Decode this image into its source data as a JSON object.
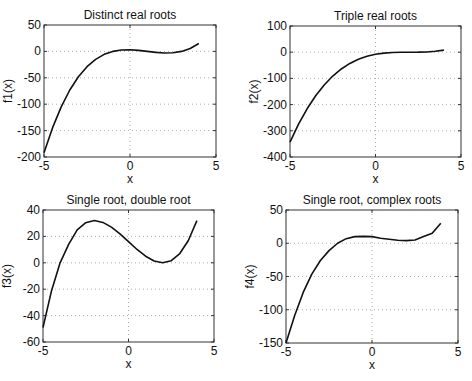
{
  "chart_data": [
    {
      "type": "line",
      "title": "Distinct real roots",
      "xlabel": "x",
      "ylabel": "f1(x)",
      "xlim": [
        -5,
        5
      ],
      "ylim": [
        -200,
        50
      ],
      "xticks": [
        -5,
        0,
        5
      ],
      "yticks": [
        -200,
        -150,
        -100,
        -50,
        0,
        50
      ],
      "grid": true,
      "function": "(x+1)(x-1)(x-3)",
      "x": [
        -5,
        -4.5,
        -4,
        -3.5,
        -3,
        -2.5,
        -2,
        -1.5,
        -1,
        -0.5,
        0,
        0.5,
        1,
        1.5,
        2,
        2.5,
        3,
        3.5,
        4
      ],
      "values": [
        -192,
        -144.4,
        -105,
        -73.1,
        -48,
        -28.9,
        -15,
        -5.6,
        0,
        2.6,
        3,
        1.9,
        0,
        -1.9,
        -3,
        -2.6,
        0,
        5.6,
        15
      ],
      "box": {
        "left": 44,
        "top": 25,
        "right": 216,
        "bottom": 157
      }
    },
    {
      "type": "line",
      "title": "Triple real roots",
      "xlabel": "x",
      "ylabel": "f2(x)",
      "xlim": [
        -5,
        5
      ],
      "ylim": [
        -400,
        100
      ],
      "xticks": [
        -5,
        0,
        5
      ],
      "yticks": [
        -400,
        -300,
        -200,
        -100,
        0,
        100
      ],
      "grid": true,
      "function": "(x-2)^3",
      "x": [
        -5,
        -4.5,
        -4,
        -3.5,
        -3,
        -2.5,
        -2,
        -1.5,
        -1,
        -0.5,
        0,
        0.5,
        1,
        1.5,
        2,
        2.5,
        3,
        3.5,
        4
      ],
      "values": [
        -343,
        -274.6,
        -216,
        -166.4,
        -125,
        -91.1,
        -64,
        -42.9,
        -27,
        -15.6,
        -8,
        -3.4,
        -1,
        -0.1,
        0,
        0.1,
        1,
        3.4,
        8
      ],
      "box": {
        "left": 290,
        "top": 26,
        "right": 461,
        "bottom": 157
      }
    },
    {
      "type": "line",
      "title": "Single root, double root",
      "xlabel": "x",
      "ylabel": "f3(x)",
      "xlim": [
        -5,
        5
      ],
      "ylim": [
        -60,
        40
      ],
      "xticks": [
        -5,
        0,
        5
      ],
      "yticks": [
        -60,
        -40,
        -20,
        0,
        20,
        40
      ],
      "grid": true,
      "function": "(x-2)^2 (x+4)",
      "x": [
        -5,
        -4.5,
        -4,
        -3.5,
        -3,
        -2.5,
        -2,
        -1.5,
        -1,
        -0.5,
        0,
        0.5,
        1,
        1.5,
        2,
        2.5,
        3,
        3.5,
        4
      ],
      "values": [
        -49,
        -21.1,
        0,
        13.9,
        25,
        30.4,
        32,
        30.6,
        27,
        21.9,
        16,
        10.1,
        5,
        1.4,
        0,
        1.6,
        7,
        16.9,
        32
      ],
      "box": {
        "left": 43,
        "top": 210,
        "right": 214,
        "bottom": 342
      }
    },
    {
      "type": "line",
      "title": "Single root, complex roots",
      "xlabel": "x",
      "ylabel": "f4(x)",
      "xlim": [
        -5,
        5
      ],
      "ylim": [
        -150,
        50
      ],
      "xticks": [
        -5,
        0,
        5
      ],
      "yticks": [
        -150,
        -100,
        -50,
        0,
        50
      ],
      "grid": true,
      "function": "(x+2)(x^2-4x+5)",
      "x": [
        -5,
        -4.5,
        -4,
        -3.5,
        -3,
        -2.5,
        -2,
        -1.5,
        -1,
        -0.5,
        0,
        0.5,
        1,
        1.5,
        2,
        2.5,
        3,
        3.5,
        4
      ],
      "values": [
        -150,
        -109.1,
        -74,
        -46.4,
        -26,
        -11.1,
        0,
        6.9,
        10,
        10.4,
        10,
        7.6,
        6,
        4.4,
        4,
        4.9,
        10,
        14.9,
        30
      ],
      "box": {
        "left": 286,
        "top": 210,
        "right": 458,
        "bottom": 343
      }
    }
  ],
  "style": {
    "line_color": "#111111",
    "axis_color": "#333333",
    "grid_color": "#9a9a9a",
    "background": "#ffffff"
  }
}
